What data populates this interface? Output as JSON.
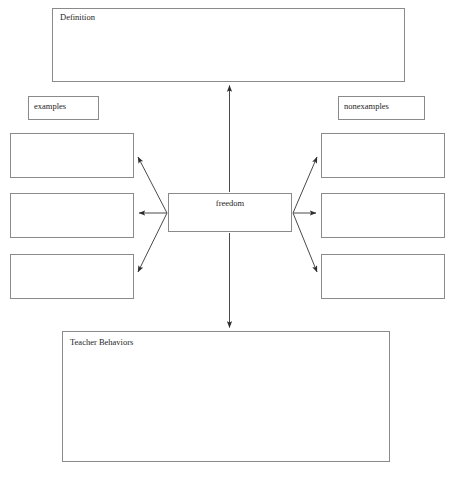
{
  "diagram": {
    "type": "concept-map",
    "center": {
      "label": "freedom"
    },
    "definition": {
      "label": "Definition",
      "content": ""
    },
    "teacher_behaviors": {
      "label": "Teacher Behaviors",
      "content": ""
    },
    "columns": {
      "examples": {
        "heading": "examples",
        "slots": [
          "",
          "",
          ""
        ]
      },
      "nonexamples": {
        "heading": "nonexamples",
        "slots": [
          "",
          "",
          ""
        ]
      }
    },
    "caption": "",
    "colors": {
      "stroke": "#8a8a8a",
      "arrow": "#3a3a3a",
      "text": "#1e1e1e",
      "background": "#ffffff"
    }
  }
}
